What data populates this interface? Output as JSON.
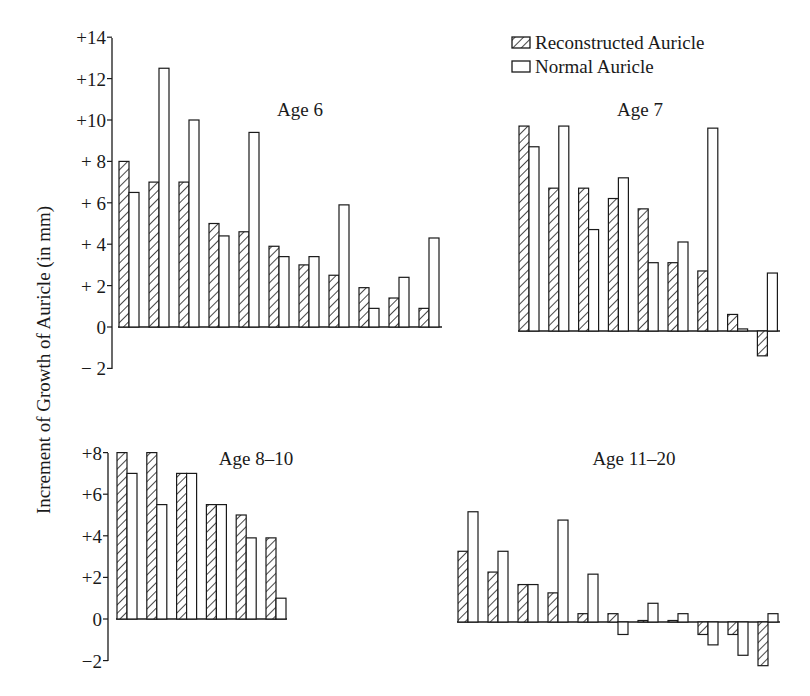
{
  "figure": {
    "ylabel": "Increment of Growth of Auricle (in mm)",
    "legend": {
      "reconstructed": "Reconstructed Auricle",
      "normal": "Normal Auricle"
    },
    "colors": {
      "ink": "#1a1a1a",
      "background": "#ffffff"
    }
  },
  "chart_data": [
    {
      "type": "bar",
      "title": "Age 6",
      "xlabel": "",
      "ylabel": "Increment of Growth of Auricle (in mm)",
      "ylim": [
        -2,
        14
      ],
      "yticks": [
        "+14",
        "+12",
        "+10",
        "+ 8",
        "+ 6",
        "+ 4",
        "+ 2",
        "0",
        "− 2"
      ],
      "grid": false,
      "legend_position": "top-right",
      "categories": [
        "1",
        "2",
        "3",
        "4",
        "5",
        "6",
        "7",
        "8",
        "9",
        "10",
        "11"
      ],
      "series": [
        {
          "name": "Reconstructed Auricle",
          "values": [
            8.0,
            7.0,
            7.0,
            5.0,
            4.6,
            3.9,
            3.0,
            2.5,
            1.9,
            1.4,
            0.9
          ]
        },
        {
          "name": "Normal Auricle",
          "values": [
            6.5,
            12.5,
            10.0,
            4.4,
            9.4,
            3.4,
            3.4,
            5.9,
            0.9,
            2.4,
            4.3
          ]
        }
      ]
    },
    {
      "type": "bar",
      "title": "Age 7",
      "xlabel": "",
      "ylabel": "Increment of Growth of Auricle (in mm)",
      "ylim": [
        -2,
        14
      ],
      "grid": false,
      "categories": [
        "1",
        "2",
        "3",
        "4",
        "5",
        "6",
        "7",
        "8",
        "9"
      ],
      "series": [
        {
          "name": "Reconstructed Auricle",
          "values": [
            9.9,
            6.9,
            6.9,
            6.4,
            5.9,
            3.3,
            2.9,
            0.8,
            -1.2
          ]
        },
        {
          "name": "Normal Auricle",
          "values": [
            8.9,
            9.9,
            4.9,
            7.4,
            3.3,
            4.3,
            9.8,
            0.1,
            2.8
          ]
        }
      ]
    },
    {
      "type": "bar",
      "title": "Age 8–10",
      "xlabel": "",
      "ylabel": "Increment of Growth of Auricle (in mm)",
      "ylim": [
        -2,
        8
      ],
      "yticks": [
        "+8",
        "+6",
        "+4",
        "+2",
        "0",
        "−2"
      ],
      "grid": false,
      "categories": [
        "1",
        "2",
        "3",
        "4",
        "5",
        "6"
      ],
      "series": [
        {
          "name": "Reconstructed Auricle",
          "values": [
            8.0,
            8.0,
            7.0,
            5.5,
            5.0,
            3.9
          ]
        },
        {
          "name": "Normal Auricle",
          "values": [
            7.0,
            5.5,
            7.0,
            5.5,
            3.9,
            1.0
          ]
        }
      ]
    },
    {
      "type": "bar",
      "title": "Age 11–20",
      "xlabel": "",
      "ylabel": "Increment of Growth of Auricle (in mm)",
      "ylim": [
        -2,
        8
      ],
      "grid": false,
      "categories": [
        "1",
        "2",
        "3",
        "4",
        "5",
        "6",
        "7",
        "8",
        "9",
        "10",
        "11"
      ],
      "series": [
        {
          "name": "Reconstructed Auricle",
          "values": [
            3.4,
            2.4,
            1.8,
            1.4,
            0.4,
            0.4,
            0.05,
            0.05,
            -0.6,
            -0.6,
            -2.1
          ]
        },
        {
          "name": "Normal Auricle",
          "values": [
            5.3,
            3.4,
            1.8,
            4.9,
            2.3,
            -0.6,
            0.9,
            0.4,
            -1.1,
            -1.6,
            0.4
          ]
        }
      ]
    }
  ]
}
